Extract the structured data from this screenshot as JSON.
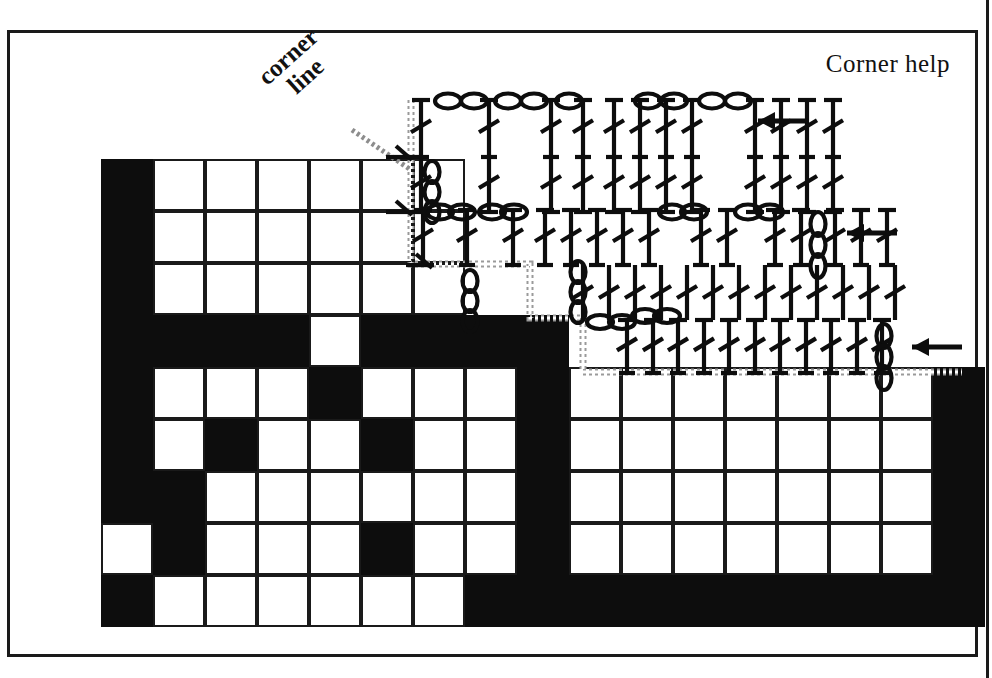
{
  "document": {
    "kind": "crochet-filet-chart-with-symbol-diagram",
    "title_text": "Corner help",
    "annotation_label": "corner\nline",
    "annotation_label_line1": "corner",
    "annotation_label_line2": "line"
  },
  "colors": {
    "ink": "#0d0d0d",
    "frame": "#1a1a1a",
    "paper": "#ffffff",
    "corner_line_gray": "#9a9a9a",
    "filled_cell": "#0d0d0d"
  },
  "grid": {
    "origin_x": 101,
    "origin_y": 159,
    "cell": 52,
    "cols": 17,
    "rows": 9,
    "legend": {
      "1": "filled square (block)",
      "0": "open square (mesh/space)",
      "-": "no cell drawn"
    },
    "rows_data": [
      "1000000----------",
      "1000000----------",
      "1000000----------",
      "111101111--------",
      "100010001-------1",
      "101001001-------1",
      "110000001-------1",
      "010001001-------1",
      "100000111111111 1"
    ],
    "rows_matrix": [
      [
        1,
        0,
        0,
        0,
        0,
        0,
        0,
        null,
        null,
        null,
        null,
        null,
        null,
        null,
        null,
        null,
        null
      ],
      [
        1,
        0,
        0,
        0,
        0,
        0,
        0,
        null,
        null,
        null,
        null,
        null,
        null,
        null,
        null,
        null,
        null
      ],
      [
        1,
        0,
        0,
        0,
        0,
        0,
        0,
        null,
        null,
        null,
        null,
        null,
        null,
        null,
        null,
        null,
        null
      ],
      [
        1,
        1,
        1,
        1,
        0,
        1,
        1,
        1,
        1,
        null,
        null,
        null,
        null,
        null,
        null,
        null,
        null
      ],
      [
        1,
        0,
        0,
        0,
        1,
        0,
        0,
        0,
        1,
        0,
        0,
        0,
        0,
        0,
        0,
        0,
        1
      ],
      [
        1,
        0,
        1,
        0,
        0,
        1,
        0,
        0,
        1,
        0,
        0,
        0,
        0,
        0,
        0,
        0,
        1
      ],
      [
        1,
        1,
        0,
        0,
        0,
        0,
        0,
        0,
        1,
        0,
        0,
        0,
        0,
        0,
        0,
        0,
        1
      ],
      [
        0,
        1,
        0,
        0,
        0,
        1,
        0,
        0,
        1,
        0,
        0,
        0,
        0,
        0,
        0,
        0,
        1
      ],
      [
        1,
        0,
        0,
        0,
        0,
        0,
        0,
        1,
        1,
        1,
        1,
        1,
        1,
        1,
        1,
        1,
        1
      ]
    ]
  },
  "corner_line": {
    "description": "gray dotted staircase marking the mitred corner of the border",
    "stroke": "#9a9a9a",
    "style": "dotted-checker",
    "points": [
      [
        411,
        100
      ],
      [
        411,
        264
      ],
      [
        530,
        264
      ],
      [
        530,
        318
      ],
      [
        583,
        318
      ],
      [
        583,
        372
      ],
      [
        962,
        372
      ]
    ]
  },
  "leader_line": {
    "description": "thin gray leader from the 'corner line' label to the staircase",
    "from": [
      352,
      130
    ],
    "to": [
      411,
      170
    ]
  },
  "stitch_rows": [
    {
      "id": "row-top",
      "baseline_y": 157,
      "arrow": {
        "x": 758,
        "y": 121,
        "direction": "left"
      },
      "turning_chain": {
        "x": 725,
        "top": 100,
        "links": 3
      },
      "symbols": "dc,ch2,dc,ch2,dc,ch2,dc,dc,dc,dc,ch2,dc,dc,dc"
    },
    {
      "id": "row-middle",
      "baseline_y": 265,
      "arrow": {
        "x": 847,
        "y": 233,
        "direction": "left"
      },
      "turning_chain": {
        "x": 818,
        "top": 210,
        "links": 3
      },
      "symbols": "dc,ch2,dc,ch2,dc,dc,dc,dc,ch2,dc,ch2,dc,ch2,dc,dc,dc"
    },
    {
      "id": "row-bottom",
      "baseline_y": 373,
      "arrow": {
        "x": 912,
        "y": 347,
        "direction": "left"
      },
      "turning_chain": {
        "x": 884,
        "top": 320,
        "links": 3
      },
      "symbols": "dc,dc,dc,dc,dc,dc,dc,dc,dc,dc,dc,dc,dc,dc,dc,dc,dc,dc"
    }
  ],
  "symbol_key": {
    "dc": "double crochet - vertical post with cross-bar top and single diagonal slash",
    "ch": "chain - small oval link",
    "arrow": "work direction arrow pointing left"
  }
}
